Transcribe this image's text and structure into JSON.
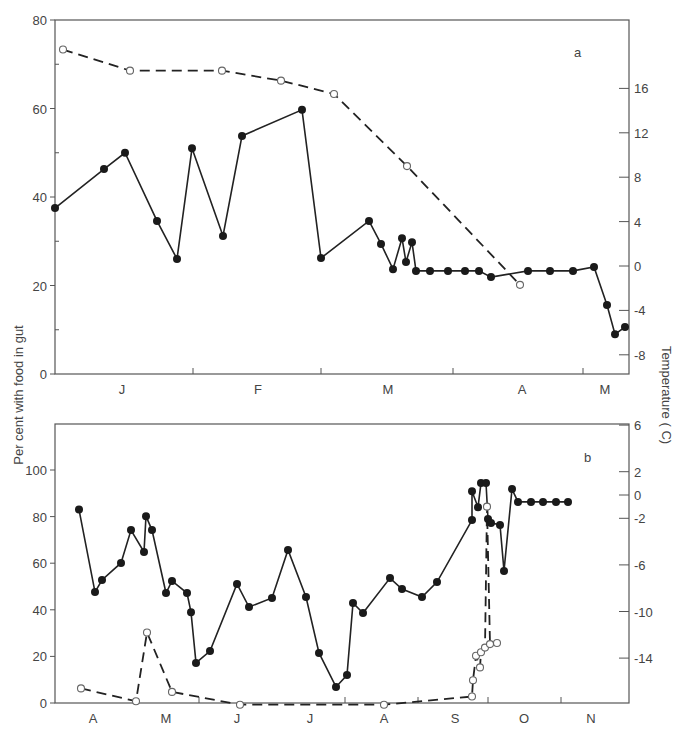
{
  "figure": {
    "left_axis_label": "Per cent with food in gut",
    "right_axis_label": "Temperature ( C)"
  },
  "chart_data": [
    {
      "panel": "a",
      "type": "line",
      "title": "a",
      "xlabel": "",
      "ylabel": "Per cent with food in gut",
      "ylabel_right": "Temperature ( C)",
      "x_tick_labels": [
        "J",
        "F",
        "M",
        "A",
        "M"
      ],
      "ylim": [
        0,
        80
      ],
      "y_ticks": [
        0,
        20,
        40,
        60,
        80
      ],
      "y_ticks_right": [
        -8,
        -4,
        0,
        4,
        8,
        12,
        16
      ],
      "ylim_right": [
        -10,
        22
      ],
      "grid": false,
      "series": [
        {
          "name": "Per cent with food in gut",
          "marker": "filled-circle",
          "line": "solid",
          "axis": "left",
          "x": [
            55,
            104,
            125,
            157,
            177,
            192,
            223,
            242,
            302,
            321,
            369,
            381,
            393,
            402,
            406,
            412,
            416,
            430,
            448,
            465,
            479,
            491,
            528,
            550,
            573,
            594,
            607,
            615,
            625
          ],
          "values": [
            37.5,
            46.3,
            50,
            34.6,
            26,
            51,
            31.2,
            53.8,
            59.7,
            26.2,
            34.6,
            29.4,
            23.7,
            30.7,
            25.3,
            29.8,
            23.3,
            23.3,
            23.3,
            23.3,
            23.3,
            21.9,
            23.3,
            23.3,
            23.3,
            24.2,
            15.6,
            9,
            10.6
          ]
        },
        {
          "name": "Temperature",
          "marker": "open-circle",
          "line": "dashed",
          "axis": "right",
          "x": [
            63,
            130,
            222,
            281,
            334,
            407,
            520
          ],
          "values": [
            19.5,
            17.6,
            17.6,
            16.7,
            15.5,
            9,
            -1.7
          ]
        }
      ]
    },
    {
      "panel": "b",
      "type": "line",
      "title": "b",
      "xlabel": "",
      "ylabel": "Per cent with food in gut",
      "ylabel_right": "Temperature ( C)",
      "x_tick_labels": [
        "A",
        "M",
        "J",
        "J",
        "A",
        "S",
        "O",
        "N"
      ],
      "ylim": [
        0,
        120
      ],
      "y_ticks": [
        0,
        20,
        40,
        60,
        80,
        100
      ],
      "y_ticks_right": [
        -14,
        -10,
        -6,
        -2,
        0,
        2,
        6
      ],
      "ylim_right": [
        -18,
        6
      ],
      "grid": false,
      "series": [
        {
          "name": "Per cent with food in gut",
          "marker": "filled-circle",
          "line": "solid",
          "axis": "left",
          "x": [
            79,
            95,
            102,
            121,
            131,
            144,
            146,
            152,
            166,
            172,
            187,
            191,
            196,
            210,
            237,
            249,
            272,
            288,
            306,
            319,
            336,
            347,
            353,
            363,
            390,
            402,
            422,
            437,
            472,
            472,
            478,
            481,
            486,
            488,
            491,
            500,
            504,
            512,
            518,
            531,
            543,
            556,
            568
          ],
          "values": [
            83,
            47.6,
            52.8,
            60.1,
            74.2,
            64.8,
            80.2,
            74.2,
            47.2,
            52.4,
            47.2,
            39,
            17.2,
            22.3,
            51.1,
            41.2,
            45.1,
            65.7,
            45.5,
            21.5,
            6.9,
            12,
            42.9,
            38.6,
            53.6,
            48.9,
            45.5,
            51.9,
            78.5,
            90.9,
            84,
            94.4,
            94.4,
            79,
            77.3,
            76.4,
            56.7,
            91.8,
            86.3,
            86.3,
            86.3,
            86.3,
            86.3
          ]
        },
        {
          "name": "Temperature",
          "marker": "open-circle",
          "line": "dashed",
          "axis": "right",
          "x": [
            81,
            136,
            147,
            172,
            240,
            384,
            472,
            473,
            476,
            480,
            481,
            485,
            487,
            490,
            497
          ],
          "values": [
            -16.6,
            -17.7,
            -11.8,
            -16.9,
            -18,
            -18,
            -17.3,
            -15.9,
            -13.8,
            -14.8,
            -13.5,
            -13.1,
            -1,
            -12.8,
            -12.7
          ]
        }
      ]
    }
  ]
}
